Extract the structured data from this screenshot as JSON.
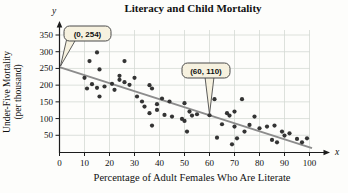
{
  "chart_data": {
    "type": "scatter",
    "title": "Literacy and Child Mortality",
    "xlabel": "Percentage of Adult Females Who Are Literate",
    "ylabel_line1": "Under-Five Mortality",
    "ylabel_line2": "(per thousand)",
    "x_axis_letter": "x",
    "y_axis_letter": "y",
    "xlim": [
      0,
      105
    ],
    "ylim": [
      0,
      365
    ],
    "x_ticks": [
      0,
      10,
      20,
      30,
      40,
      50,
      60,
      70,
      80,
      90,
      100
    ],
    "y_ticks": [
      50,
      100,
      150,
      200,
      250,
      300,
      350
    ],
    "grid": true,
    "points": [
      [
        10,
        222
      ],
      [
        11,
        190
      ],
      [
        12,
        272
      ],
      [
        13,
        203
      ],
      [
        15,
        298
      ],
      [
        15,
        192
      ],
      [
        16,
        247
      ],
      [
        16,
        166
      ],
      [
        18,
        196
      ],
      [
        21,
        204
      ],
      [
        22,
        186
      ],
      [
        24,
        228
      ],
      [
        24,
        216
      ],
      [
        26,
        272
      ],
      [
        26,
        209
      ],
      [
        28,
        201
      ],
      [
        30,
        222
      ],
      [
        31,
        166
      ],
      [
        33,
        151
      ],
      [
        34,
        136
      ],
      [
        36,
        200
      ],
      [
        37,
        190
      ],
      [
        36,
        116
      ],
      [
        37,
        79
      ],
      [
        39,
        143
      ],
      [
        39,
        126
      ],
      [
        41,
        160
      ],
      [
        42,
        111
      ],
      [
        44,
        151
      ],
      [
        45,
        106
      ],
      [
        49,
        99
      ],
      [
        50,
        146
      ],
      [
        50,
        93
      ],
      [
        51,
        61
      ],
      [
        52,
        121
      ],
      [
        53,
        109
      ],
      [
        55,
        113
      ],
      [
        60,
        110
      ],
      [
        62,
        158
      ],
      [
        63,
        43
      ],
      [
        65,
        83
      ],
      [
        67,
        116
      ],
      [
        68,
        109
      ],
      [
        69,
        23
      ],
      [
        70,
        121
      ],
      [
        70,
        76
      ],
      [
        71,
        41
      ],
      [
        73,
        158
      ],
      [
        74,
        61
      ],
      [
        76,
        81
      ],
      [
        78,
        106
      ],
      [
        80,
        71
      ],
      [
        83,
        76
      ],
      [
        85,
        36
      ],
      [
        86,
        79
      ],
      [
        87,
        29
      ],
      [
        89,
        61
      ],
      [
        90,
        49
      ],
      [
        92,
        56
      ],
      [
        95,
        39
      ],
      [
        97,
        29
      ],
      [
        99,
        41
      ]
    ],
    "trend_line": {
      "x1": 0,
      "y1": 254,
      "x2": 101,
      "y2": 11.6
    },
    "annotations": [
      {
        "label": "(0, 254)",
        "x": 0,
        "y": 254
      },
      {
        "label": "(60, 110)",
        "x": 60,
        "y": 110
      }
    ],
    "colors": {
      "dot": "#343434",
      "trend_line": "#8c8c8c",
      "grid_line": "#d4d9d4",
      "axis": "#1c1c1c",
      "callout_fill": "#f6f1df",
      "callout_border": "#4a4a4a",
      "text": "#111111"
    }
  }
}
